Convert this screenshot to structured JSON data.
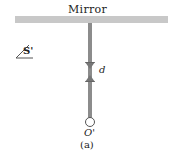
{
  "figure": {
    "mirror_label": "Mirror",
    "observer_label": "S'",
    "distance_label": "d",
    "origin_label": "O'",
    "caption": "(a)"
  },
  "colors": {
    "mirror": "#c8c8c8",
    "rod": "#8c8c8c",
    "text": "#222222"
  }
}
